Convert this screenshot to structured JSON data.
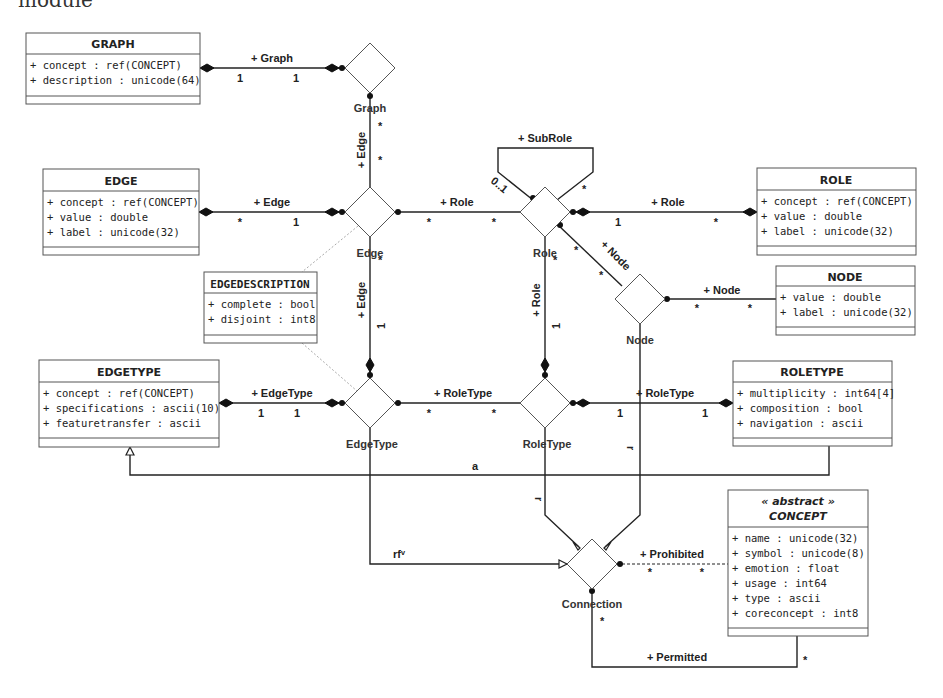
{
  "header": {
    "text": "module"
  },
  "classes": {
    "graph": {
      "title": "GRAPH",
      "attributes": [
        "+ concept : ref(CONCEPT)",
        "+ description : unicode(64)"
      ]
    },
    "edge": {
      "title": "EDGE",
      "attributes": [
        "+ concept : ref(CONCEPT)",
        "+ value : double",
        "+ label : unicode(32)"
      ]
    },
    "role": {
      "title": "ROLE",
      "attributes": [
        "+ concept : ref(CONCEPT)",
        "+ value : double",
        "+ label : unicode(32)"
      ]
    },
    "node": {
      "title": "NODE",
      "attributes": [
        "+ value : double",
        "+ label : unicode(32)"
      ]
    },
    "edgedescription": {
      "title": "EDGEDESCRIPTION",
      "attributes": [
        "+ complete : bool",
        "+ disjoint : int8"
      ]
    },
    "edgetype": {
      "title": "EDGETYPE",
      "attributes": [
        "+ concept : ref(CONCEPT)",
        "+ specifications : ascii(10)",
        "+ featuretransfer : ascii"
      ]
    },
    "roletype": {
      "title": "ROLETYPE",
      "attributes": [
        "+ multiplicity : int64[4]",
        "+ composition : bool",
        "+ navigation : ascii"
      ]
    },
    "concept": {
      "stereotype": "« abstract »",
      "title": "CONCEPT",
      "attributes": [
        "+ name : unicode(32)",
        "+ symbol : unicode(8)",
        "+ emotion : float",
        "+ usage : int64",
        "+ type : ascii",
        "+ coreconcept : int8"
      ]
    }
  },
  "association_classes": {
    "graph": "Graph",
    "edge": "Edge",
    "role": "Role",
    "node": "Node",
    "edgetype": "EdgeType",
    "roletype": "RoleType",
    "connection": "Connection"
  },
  "associations": {
    "graph_graph": {
      "label": "+ Graph",
      "mult_left": "1",
      "mult_right": "1"
    },
    "graph_edge": {
      "label": "+ Edge",
      "mult_a": "*",
      "mult_b": "*"
    },
    "edge_edge": {
      "label": "+ Edge",
      "mult_left": "*",
      "mult_right": "1"
    },
    "edge_role": {
      "label": "+ Role",
      "mult_left": "*",
      "mult_right": "*"
    },
    "subrole": {
      "label": "+ SubRole",
      "mult_left": "0..1",
      "mult_right": "*"
    },
    "role_role": {
      "label": "+ Role",
      "mult_left": "1",
      "mult_right": "*"
    },
    "role_node": {
      "label": "+ Node",
      "mult_a": "*",
      "mult_b": "*"
    },
    "node_node": {
      "label": "+ Node",
      "mult_left": "*",
      "mult_right": "*"
    },
    "edge_edgetype": {
      "label": "+ Edge",
      "mult_top": "*",
      "mult_bottom": "1"
    },
    "role_roletype": {
      "label": "+ Role",
      "mult_top": "*",
      "mult_bottom": "1"
    },
    "edgetype_edgetype": {
      "label": "+ EdgeType",
      "mult_left": "1",
      "mult_right": "1"
    },
    "edgetype_roletype": {
      "label": "+ RoleType",
      "mult_left": "*",
      "mult_right": "*"
    },
    "roletype_roletype": {
      "label": "+ RoleType",
      "mult_left": "1",
      "mult_right": "1"
    },
    "generalization_a": {
      "label": "a"
    },
    "roletype_connection": {
      "label": "r"
    },
    "node_connection": {
      "label": "r"
    },
    "edgetype_connection": {
      "label": "rfᵛ"
    },
    "prohibited": {
      "label": "+ Prohibited",
      "mult_left": "*",
      "mult_right": "*"
    },
    "permitted": {
      "label": "+ Permitted",
      "mult_left": "*",
      "mult_right": "*"
    }
  }
}
